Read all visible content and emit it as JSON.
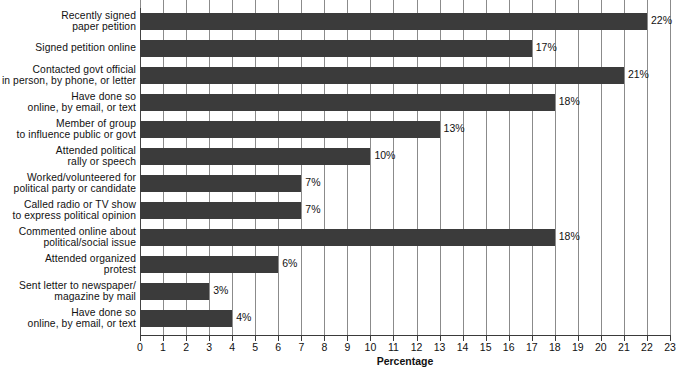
{
  "chart_data": {
    "type": "bar",
    "orientation": "horizontal",
    "title": "",
    "xlabel": "Percentage",
    "ylabel": "",
    "xlim": [
      0,
      23
    ],
    "xticks": [
      0,
      1,
      2,
      3,
      4,
      5,
      6,
      7,
      8,
      9,
      10,
      11,
      12,
      13,
      14,
      15,
      16,
      17,
      18,
      19,
      20,
      21,
      22,
      23
    ],
    "xtick_labels": [
      "0",
      "1",
      "2",
      "3",
      "4",
      "5",
      "6",
      "7",
      "8",
      "9",
      "10",
      "11",
      "12",
      "13",
      "14",
      "15",
      "16",
      "17",
      "18",
      "19",
      "20",
      "21",
      "22",
      "23"
    ],
    "grid": true,
    "grid_axis": "x",
    "legend": false,
    "bar_color": "#3b3b3b",
    "value_suffix": "%",
    "categories": [
      "Recently signed\npaper petition",
      "Signed petition online",
      "Contacted govt official\nin person, by phone, or letter",
      "Have done so\nonline, by email, or text",
      "Member of group\nto influence public or govt",
      "Attended political\nrally or speech",
      "Worked/volunteered for\npolitical party or candidate",
      "Called radio or TV show\nto express political opinion",
      "Commented online about\npolitical/social issue",
      "Attended organized\nprotest",
      "Sent letter to newspaper/\nmagazine by mail",
      "Have done so\nonline, by email, or text"
    ],
    "values": [
      22,
      17,
      21,
      18,
      13,
      10,
      7,
      7,
      18,
      6,
      3,
      4
    ],
    "data_labels": [
      "22%",
      "17%",
      "21%",
      "18%",
      "13%",
      "10%",
      "7%",
      "7%",
      "18%",
      "6%",
      "3%",
      "4%"
    ],
    "bars": [
      {
        "label_line1": "Recently signed",
        "label_line2": "paper petition",
        "value": 22,
        "data_label": "22%"
      },
      {
        "label_line1": "Signed petition online",
        "label_line2": "",
        "value": 17,
        "data_label": "17%"
      },
      {
        "label_line1": "Contacted govt official",
        "label_line2": "in person, by phone, or letter",
        "value": 21,
        "data_label": "21%"
      },
      {
        "label_line1": "Have done so",
        "label_line2": "online, by email, or text",
        "value": 18,
        "data_label": "18%"
      },
      {
        "label_line1": "Member of group",
        "label_line2": "to influence public or govt",
        "value": 13,
        "data_label": "13%"
      },
      {
        "label_line1": "Attended political",
        "label_line2": "rally or speech",
        "value": 10,
        "data_label": "10%"
      },
      {
        "label_line1": "Worked/volunteered for",
        "label_line2": "political party or candidate",
        "value": 7,
        "data_label": "7%"
      },
      {
        "label_line1": "Called radio or TV show",
        "label_line2": "to express political opinion",
        "value": 7,
        "data_label": "7%"
      },
      {
        "label_line1": "Commented online about",
        "label_line2": "political/social issue",
        "value": 18,
        "data_label": "18%"
      },
      {
        "label_line1": "Attended organized",
        "label_line2": "protest",
        "value": 6,
        "data_label": "6%"
      },
      {
        "label_line1": "Sent letter to newspaper/",
        "label_line2": "magazine by mail",
        "value": 3,
        "data_label": "3%"
      },
      {
        "label_line1": "Have done so",
        "label_line2": "online, by email, or text",
        "value": 4,
        "data_label": "4%"
      }
    ]
  }
}
